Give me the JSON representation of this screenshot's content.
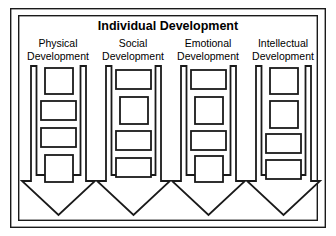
{
  "diagram": {
    "title": "Individual Development",
    "type": "flow-arrow-diagram",
    "background_color": "#ffffff",
    "stroke_color": "#1a1a1a",
    "frame": {
      "outer": {
        "x": 10,
        "y": 8,
        "width": 316,
        "height": 220
      },
      "inner": {
        "x": 18,
        "y": 15,
        "width": 300,
        "height": 206
      }
    },
    "columns": [
      {
        "id": "physical",
        "label_line1": "Physical",
        "label_line2": "Development",
        "label_center_x": 58,
        "arrow": {
          "shaft_left": 31,
          "shaft_right": 86,
          "head_left": 22,
          "head_right": 95,
          "top": 66,
          "head_top": 181,
          "tip_y": 215
        },
        "boxes": [
          {
            "x": 45,
            "y": 68,
            "width": 28,
            "height": 26
          },
          {
            "x": 41,
            "y": 101,
            "width": 35,
            "height": 19
          },
          {
            "x": 41,
            "y": 128,
            "width": 35,
            "height": 19
          },
          {
            "x": 45,
            "y": 155,
            "width": 28,
            "height": 27
          }
        ]
      },
      {
        "id": "social",
        "label_line1": "Social",
        "label_line2": "Development",
        "label_center_x": 133,
        "arrow": {
          "shaft_left": 106,
          "shaft_right": 161,
          "head_left": 97,
          "head_right": 170,
          "top": 66,
          "head_top": 181,
          "tip_y": 215
        },
        "boxes": [
          {
            "x": 116,
            "y": 70,
            "width": 35,
            "height": 19
          },
          {
            "x": 120,
            "y": 97,
            "width": 28,
            "height": 27
          },
          {
            "x": 116,
            "y": 131,
            "width": 35,
            "height": 19
          },
          {
            "x": 116,
            "y": 158,
            "width": 35,
            "height": 19
          }
        ]
      },
      {
        "id": "emotional",
        "label_line1": "Emotional",
        "label_line2": "Development",
        "label_center_x": 208,
        "arrow": {
          "shaft_left": 181,
          "shaft_right": 236,
          "head_left": 172,
          "head_right": 245,
          "top": 66,
          "head_top": 181,
          "tip_y": 215
        },
        "boxes": [
          {
            "x": 191,
            "y": 70,
            "width": 35,
            "height": 19
          },
          {
            "x": 195,
            "y": 97,
            "width": 28,
            "height": 27
          },
          {
            "x": 191,
            "y": 131,
            "width": 35,
            "height": 19
          },
          {
            "x": 195,
            "y": 156,
            "width": 28,
            "height": 26
          }
        ]
      },
      {
        "id": "intellectual",
        "label_line1": "Intellectual",
        "label_line2": "Development",
        "label_center_x": 283,
        "arrow": {
          "shaft_left": 256,
          "shaft_right": 311,
          "head_left": 247,
          "head_right": 320,
          "top": 66,
          "head_top": 181,
          "tip_y": 215
        },
        "boxes": [
          {
            "x": 270,
            "y": 68,
            "width": 28,
            "height": 26
          },
          {
            "x": 270,
            "y": 101,
            "width": 28,
            "height": 27
          },
          {
            "x": 266,
            "y": 134,
            "width": 35,
            "height": 19
          },
          {
            "x": 266,
            "y": 160,
            "width": 35,
            "height": 19
          }
        ]
      }
    ],
    "title_position": {
      "x": 168,
      "y": 29
    },
    "label_rows": {
      "line1_y": 47,
      "line2_y": 60
    }
  }
}
